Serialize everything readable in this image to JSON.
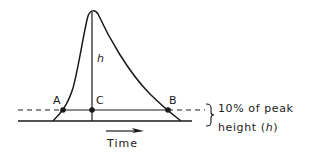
{
  "diagram": {
    "points": {
      "a": "A",
      "b": "B",
      "c": "C"
    },
    "height_label": "h",
    "axis_label": "Time",
    "annotation": {
      "line1": "10% of peak",
      "line2_prefix": "height (",
      "line2_symbol": "h",
      "line2_suffix": ")"
    },
    "colors": {
      "line": "#1a1a1a",
      "background": "#ffffff"
    }
  }
}
